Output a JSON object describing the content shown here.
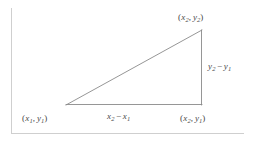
{
  "figure": {
    "type": "geometry-diagram",
    "canvas": {
      "width": 253,
      "height": 141,
      "background": "#ffffff"
    },
    "frame": {
      "stroke": "#c9c9c9",
      "left_border_x": 11,
      "left_border_y_start": 8,
      "left_border_y_end": 133,
      "bottom_border_y": 133,
      "bottom_border_x_start": 11,
      "bottom_border_x_end": 244
    },
    "triangle": {
      "stroke": "#8a8a8a",
      "stroke_width": 0.9,
      "fill": "none",
      "vertices": {
        "left": {
          "x": 66,
          "y": 105,
          "label": "(x1, y1)"
        },
        "top_right": {
          "x": 202,
          "y": 30,
          "label": "(x2, y2)"
        },
        "bottom_right": {
          "x": 202,
          "y": 105,
          "label": "(x2, y1)"
        }
      }
    },
    "labels": {
      "top_right_vertex": {
        "open": "(",
        "x_var": "x",
        "x_sub": "2",
        "comma": ",",
        "y_var": "y",
        "y_sub": "2",
        "close": ")"
      },
      "bottom_left_vertex": {
        "open": "(",
        "x_var": "x",
        "x_sub": "1",
        "comma": ",",
        "y_var": "y",
        "y_sub": "1",
        "close": ")"
      },
      "bottom_right_vertex": {
        "open": "(",
        "x_var": "x",
        "x_sub": "2",
        "comma": ",",
        "y_var": "y",
        "y_sub": "1",
        "close": ")"
      },
      "vertical_leg": {
        "first_var": "y",
        "first_sub": "2",
        "operator": "−",
        "second_var": "y",
        "second_sub": "1"
      },
      "horizontal_leg": {
        "first_var": "x",
        "first_sub": "2",
        "operator": "−",
        "second_var": "x",
        "second_sub": "1"
      }
    }
  }
}
